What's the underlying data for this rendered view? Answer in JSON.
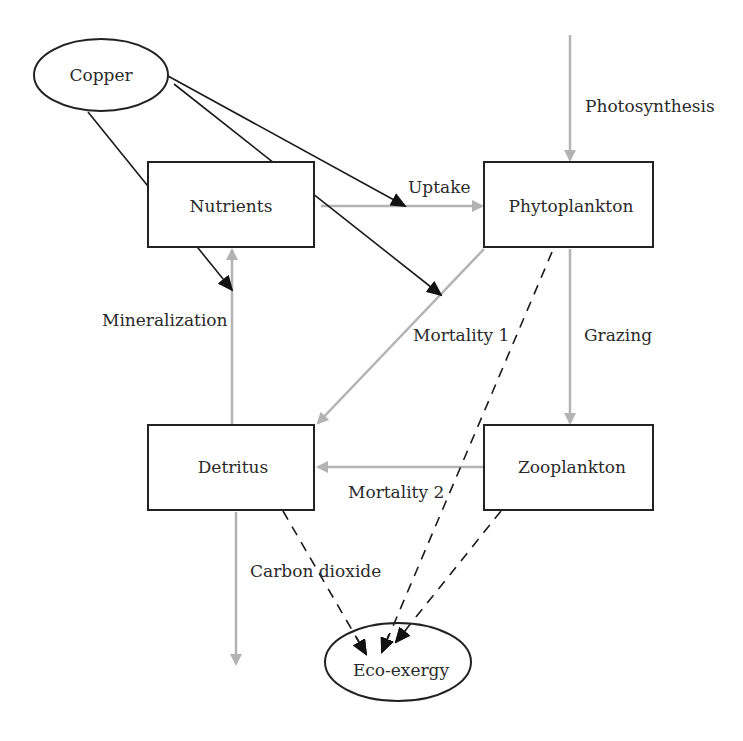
{
  "diagram": {
    "nodes": {
      "copper": {
        "label": "Copper",
        "shape": "ellipse"
      },
      "nutrients": {
        "label": "Nutrients",
        "shape": "box"
      },
      "phytoplankton": {
        "label": "Phytoplankton",
        "shape": "box"
      },
      "detritus": {
        "label": "Detritus",
        "shape": "box"
      },
      "zooplankton": {
        "label": "Zooplankton",
        "shape": "box"
      },
      "eco_exergy": {
        "label": "Eco-exergy",
        "shape": "ellipse"
      }
    },
    "flows": {
      "photosynthesis": "Photosynthesis",
      "uptake": "Uptake",
      "mineralization": "Mineralization",
      "mortality1": "Mortality 1",
      "grazing": "Grazing",
      "mortality2": "Mortality 2",
      "carbon_dioxide": "Carbon dioxide"
    },
    "edges": [
      {
        "from": "external",
        "to": "phytoplankton",
        "label": "Photosynthesis",
        "style": "gray-solid"
      },
      {
        "from": "nutrients",
        "to": "phytoplankton",
        "label": "Uptake",
        "style": "gray-solid"
      },
      {
        "from": "detritus",
        "to": "nutrients",
        "label": "Mineralization",
        "style": "gray-solid"
      },
      {
        "from": "phytoplankton",
        "to": "detritus",
        "label": "Mortality 1",
        "style": "gray-solid"
      },
      {
        "from": "phytoplankton",
        "to": "zooplankton",
        "label": "Grazing",
        "style": "gray-solid"
      },
      {
        "from": "zooplankton",
        "to": "detritus",
        "label": "Mortality 2",
        "style": "gray-solid"
      },
      {
        "from": "detritus",
        "to": "external",
        "label": "Carbon dioxide",
        "style": "gray-solid"
      },
      {
        "from": "copper",
        "to": "uptake",
        "style": "black-solid"
      },
      {
        "from": "copper",
        "to": "mortality1",
        "style": "black-solid"
      },
      {
        "from": "copper",
        "to": "mineralization",
        "style": "black-solid"
      },
      {
        "from": "detritus",
        "to": "eco_exergy",
        "style": "black-dashed"
      },
      {
        "from": "phytoplankton",
        "to": "eco_exergy",
        "style": "black-dashed"
      },
      {
        "from": "zooplankton",
        "to": "eco_exergy",
        "style": "black-dashed"
      }
    ],
    "colors": {
      "flow": "#b3b3b3",
      "copper_effect": "#1a1a1a",
      "outline": "#222222"
    }
  }
}
